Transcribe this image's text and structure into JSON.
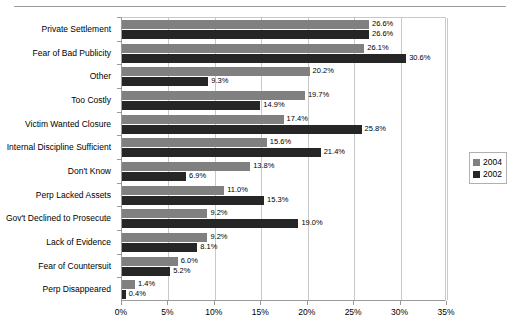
{
  "chart_data": {
    "type": "bar",
    "orientation": "horizontal",
    "title": "",
    "xlabel": "",
    "ylabel": "",
    "xlim": [
      0,
      35
    ],
    "xtick_labels": [
      "0%",
      "5%",
      "10%",
      "15%",
      "20%",
      "25%",
      "30%",
      "35%"
    ],
    "xtick_values": [
      0,
      5,
      10,
      15,
      20,
      25,
      30,
      35
    ],
    "grid": true,
    "legend_position": "right",
    "value_suffix": "%",
    "categories": [
      "Private Settlement",
      "Fear of Bad Publicity",
      "Other",
      "Too Costly",
      "Victim Wanted Closure",
      "Internal Discipline Sufficient",
      "Don't Know",
      "Perp Lacked Assets",
      "Gov't Declined to Prosecute",
      "Lack of Evidence",
      "Fear of Countersuit",
      "Perp Disappeared"
    ],
    "series": [
      {
        "name": "2004",
        "color": "#808080",
        "values": [
          26.6,
          26.1,
          20.2,
          19.7,
          17.4,
          15.6,
          13.8,
          11.0,
          9.2,
          9.2,
          6.0,
          1.4
        ],
        "labels": [
          "26.6%",
          "26.1%",
          "20.2%",
          "19.7%",
          "17.4%",
          "15.6%",
          "13.8%",
          "11.0%",
          "9.2%",
          "9.2%",
          "6.0%",
          "1.4%"
        ]
      },
      {
        "name": "2002",
        "color": "#262626",
        "values": [
          26.6,
          30.6,
          9.3,
          14.9,
          25.8,
          21.4,
          6.9,
          15.3,
          19.0,
          8.1,
          5.2,
          0.4
        ],
        "labels": [
          "26.6%",
          "30.6%",
          "9.3%",
          "14.9%",
          "25.8%",
          "21.4%",
          "6.9%",
          "15.3%",
          "19.0%",
          "8.1%",
          "5.2%",
          "0.4%"
        ]
      }
    ]
  }
}
